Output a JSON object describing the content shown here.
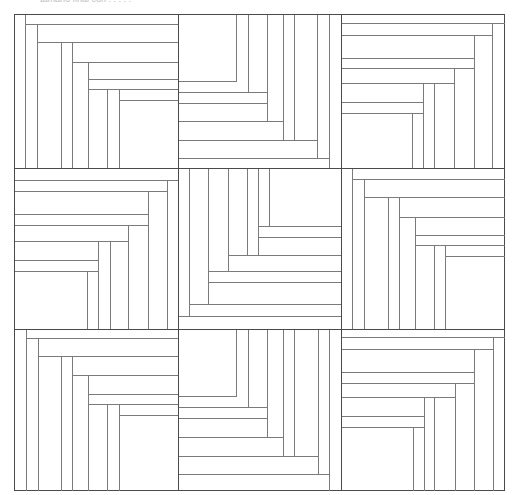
{
  "caption": "tamano final con  . . . . .",
  "diagram": {
    "grid": {
      "rows": 3,
      "cols": 3
    },
    "colors": {
      "border": "#4a4a4a",
      "line": "#7a7a7a",
      "fill": "#ffffff"
    },
    "blocks": [
      {
        "id": "r1c1",
        "x": 14,
        "y": 14,
        "w": 164,
        "h": 154,
        "lines": [
          [
            25,
            14,
            25,
            168
          ],
          [
            25,
            24,
            178,
            24
          ],
          [
            37,
            24,
            37,
            168
          ],
          [
            37,
            42,
            178,
            42
          ],
          [
            61,
            42,
            61,
            168
          ],
          [
            72,
            42,
            72,
            168
          ],
          [
            72,
            62,
            178,
            62
          ],
          [
            88,
            62,
            88,
            168
          ],
          [
            88,
            79,
            178,
            79
          ],
          [
            88,
            89,
            178,
            89
          ],
          [
            107,
            89,
            107,
            168
          ],
          [
            119,
            89,
            119,
            168
          ],
          [
            119,
            100,
            178,
            100
          ]
        ]
      },
      {
        "id": "r1c2",
        "x": 178,
        "y": 14,
        "w": 163,
        "h": 154,
        "lines": [
          [
            236,
            14,
            236,
            81
          ],
          [
            178,
            81,
            236,
            81
          ],
          [
            248,
            14,
            248,
            92
          ],
          [
            178,
            92,
            267,
            92
          ],
          [
            267,
            14,
            267,
            121
          ],
          [
            178,
            103,
            267,
            103
          ],
          [
            178,
            121,
            283,
            121
          ],
          [
            283,
            14,
            283,
            140
          ],
          [
            294,
            14,
            294,
            140
          ],
          [
            178,
            140,
            317,
            140
          ],
          [
            317,
            14,
            317,
            158
          ],
          [
            178,
            158,
            329,
            158
          ],
          [
            329,
            14,
            329,
            168
          ]
        ]
      },
      {
        "id": "r1c3",
        "x": 341,
        "y": 14,
        "w": 163,
        "h": 154,
        "lines": [
          [
            341,
            23,
            504,
            23
          ],
          [
            492,
            23,
            492,
            168
          ],
          [
            341,
            35,
            492,
            35
          ],
          [
            474,
            35,
            474,
            168
          ],
          [
            341,
            58,
            474,
            58
          ],
          [
            341,
            68,
            474,
            68
          ],
          [
            454,
            68,
            454,
            168
          ],
          [
            341,
            83,
            454,
            83
          ],
          [
            423,
            83,
            423,
            168
          ],
          [
            434,
            83,
            434,
            168
          ],
          [
            341,
            102,
            423,
            102
          ],
          [
            341,
            113,
            423,
            113
          ],
          [
            412,
            113,
            412,
            168
          ]
        ]
      },
      {
        "id": "r2c1",
        "x": 14,
        "y": 168,
        "w": 164,
        "h": 161,
        "lines": [
          [
            14,
            180,
            178,
            180
          ],
          [
            167,
            180,
            167,
            329
          ],
          [
            14,
            191,
            167,
            191
          ],
          [
            148,
            191,
            148,
            329
          ],
          [
            14,
            214,
            148,
            214
          ],
          [
            14,
            225,
            148,
            225
          ],
          [
            128,
            225,
            128,
            329
          ],
          [
            14,
            241,
            128,
            241
          ],
          [
            98,
            241,
            98,
            329
          ],
          [
            110,
            241,
            110,
            329
          ],
          [
            14,
            260,
            98,
            260
          ],
          [
            14,
            271,
            98,
            271
          ],
          [
            87,
            271,
            87,
            329
          ]
        ]
      },
      {
        "id": "r2c2",
        "x": 178,
        "y": 168,
        "w": 163,
        "h": 161,
        "lines": [
          [
            189,
            168,
            189,
            316
          ],
          [
            208,
            168,
            208,
            304
          ],
          [
            228,
            168,
            228,
            271
          ],
          [
            247,
            168,
            247,
            255
          ],
          [
            258,
            168,
            258,
            255
          ],
          [
            269,
            168,
            269,
            226
          ],
          [
            258,
            226,
            341,
            226
          ],
          [
            258,
            237,
            341,
            237
          ],
          [
            228,
            255,
            341,
            255
          ],
          [
            208,
            271,
            341,
            271
          ],
          [
            208,
            282,
            341,
            282
          ],
          [
            189,
            304,
            341,
            304
          ],
          [
            178,
            316,
            341,
            316
          ]
        ]
      },
      {
        "id": "r2c3",
        "x": 341,
        "y": 168,
        "w": 163,
        "h": 161,
        "lines": [
          [
            352,
            168,
            352,
            329
          ],
          [
            352,
            179,
            504,
            179
          ],
          [
            364,
            179,
            364,
            329
          ],
          [
            364,
            197,
            504,
            197
          ],
          [
            388,
            197,
            388,
            329
          ],
          [
            399,
            197,
            399,
            329
          ],
          [
            399,
            217,
            504,
            217
          ],
          [
            415,
            217,
            415,
            329
          ],
          [
            415,
            235,
            504,
            235
          ],
          [
            415,
            245,
            504,
            245
          ],
          [
            434,
            245,
            434,
            329
          ],
          [
            445,
            245,
            445,
            329
          ],
          [
            445,
            256,
            504,
            256
          ]
        ]
      },
      {
        "id": "r3c1",
        "x": 14,
        "y": 329,
        "w": 164,
        "h": 161,
        "lines": [
          [
            26,
            329,
            26,
            490
          ],
          [
            26,
            338,
            178,
            338
          ],
          [
            38,
            338,
            38,
            490
          ],
          [
            38,
            356,
            178,
            356
          ],
          [
            61,
            356,
            61,
            490
          ],
          [
            72,
            356,
            72,
            490
          ],
          [
            72,
            375,
            178,
            375
          ],
          [
            88,
            375,
            88,
            490
          ],
          [
            88,
            394,
            178,
            394
          ],
          [
            88,
            404,
            178,
            404
          ],
          [
            107,
            404,
            107,
            490
          ],
          [
            119,
            404,
            119,
            490
          ],
          [
            119,
            415,
            178,
            415
          ]
        ]
      },
      {
        "id": "r3c2",
        "x": 178,
        "y": 329,
        "w": 163,
        "h": 161,
        "lines": [
          [
            236,
            329,
            236,
            396
          ],
          [
            178,
            396,
            236,
            396
          ],
          [
            248,
            329,
            248,
            407
          ],
          [
            178,
            407,
            267,
            407
          ],
          [
            267,
            329,
            267,
            437
          ],
          [
            178,
            418,
            267,
            418
          ],
          [
            178,
            437,
            283,
            437
          ],
          [
            283,
            329,
            283,
            456
          ],
          [
            294,
            329,
            294,
            456
          ],
          [
            178,
            456,
            318,
            456
          ],
          [
            318,
            329,
            318,
            474
          ],
          [
            178,
            474,
            329,
            474
          ],
          [
            329,
            329,
            329,
            490
          ]
        ]
      },
      {
        "id": "r3c3",
        "x": 341,
        "y": 329,
        "w": 163,
        "h": 161,
        "lines": [
          [
            341,
            337,
            504,
            337
          ],
          [
            493,
            337,
            493,
            490
          ],
          [
            341,
            349,
            493,
            349
          ],
          [
            474,
            349,
            474,
            490
          ],
          [
            341,
            372,
            474,
            372
          ],
          [
            341,
            383,
            474,
            383
          ],
          [
            455,
            383,
            455,
            490
          ],
          [
            341,
            397,
            455,
            397
          ],
          [
            424,
            397,
            424,
            490
          ],
          [
            434,
            397,
            434,
            490
          ],
          [
            341,
            416,
            424,
            416
          ],
          [
            341,
            427,
            424,
            427
          ],
          [
            413,
            427,
            413,
            490
          ]
        ]
      }
    ]
  }
}
